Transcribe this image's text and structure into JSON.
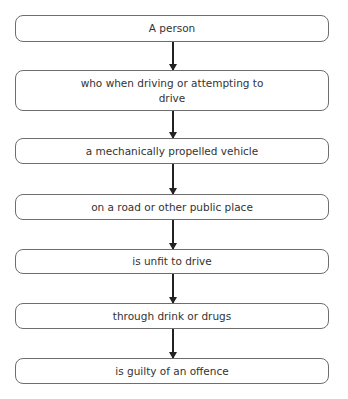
{
  "flowchart": {
    "top_cutoff_text": "...driving offence...",
    "steps": [
      {
        "label": "A person"
      },
      {
        "label": "who when driving or attempting to drive"
      },
      {
        "label": "a mechanically propelled vehicle"
      },
      {
        "label": "on a road or other public place"
      },
      {
        "label": "is unfit to drive"
      },
      {
        "label": "through drink or drugs"
      },
      {
        "label": "is guilty of an offence"
      }
    ]
  }
}
